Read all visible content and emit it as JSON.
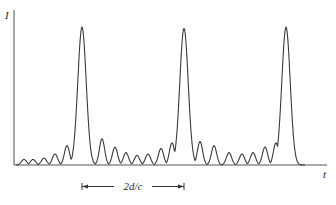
{
  "figure": {
    "y_axis_label": "I",
    "x_axis_label": "t",
    "interval_label": "2d/c",
    "colors": {
      "line": "#3a3a3a",
      "axis": "#555555",
      "text": "#2a2a2a",
      "background": "#ffffff"
    }
  },
  "chart_data": {
    "type": "line",
    "title": "",
    "xlabel": "t",
    "ylabel": "I",
    "grid": false,
    "legend": null,
    "annotations": [
      {
        "type": "interval-arrow",
        "label": "2d/c",
        "from_x": 82,
        "to_x": 184,
        "note": "spacing between main pulses"
      }
    ],
    "main_peaks": [
      {
        "x": 82,
        "height": 1.0
      },
      {
        "x": 184,
        "height": 0.99
      },
      {
        "x": 286,
        "height": 1.0
      }
    ],
    "side_lobes": [
      {
        "x": 24,
        "height": 0.04
      },
      {
        "x": 33,
        "height": 0.04
      },
      {
        "x": 44,
        "height": 0.05
      },
      {
        "x": 55,
        "height": 0.08
      },
      {
        "x": 67,
        "height": 0.14
      },
      {
        "x": 102,
        "height": 0.19
      },
      {
        "x": 115,
        "height": 0.13
      },
      {
        "x": 126,
        "height": 0.09
      },
      {
        "x": 137,
        "height": 0.07
      },
      {
        "x": 148,
        "height": 0.08
      },
      {
        "x": 161,
        "height": 0.12
      },
      {
        "x": 172,
        "height": 0.16
      },
      {
        "x": 200,
        "height": 0.17
      },
      {
        "x": 214,
        "height": 0.14
      },
      {
        "x": 229,
        "height": 0.09
      },
      {
        "x": 242,
        "height": 0.08
      },
      {
        "x": 253,
        "height": 0.09
      },
      {
        "x": 265,
        "height": 0.13
      },
      {
        "x": 276,
        "height": 0.16
      }
    ],
    "axis_px": {
      "x0": 14,
      "x1": 327,
      "baseline_y": 165,
      "top_y": 27
    }
  }
}
